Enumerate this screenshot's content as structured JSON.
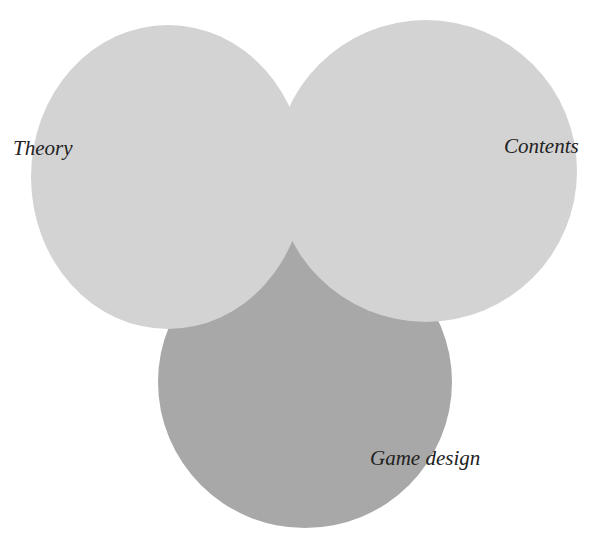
{
  "diagram": {
    "type": "venn",
    "colors": {
      "light_circle": "#d3d3d3",
      "dark_circle": "#a8a8a8",
      "label_text": "#222222",
      "background": "#ffffff"
    },
    "sets": [
      {
        "id": "theory",
        "label": "Theory"
      },
      {
        "id": "contents",
        "label": "Contents"
      },
      {
        "id": "game_design",
        "label": "Game design"
      }
    ]
  }
}
